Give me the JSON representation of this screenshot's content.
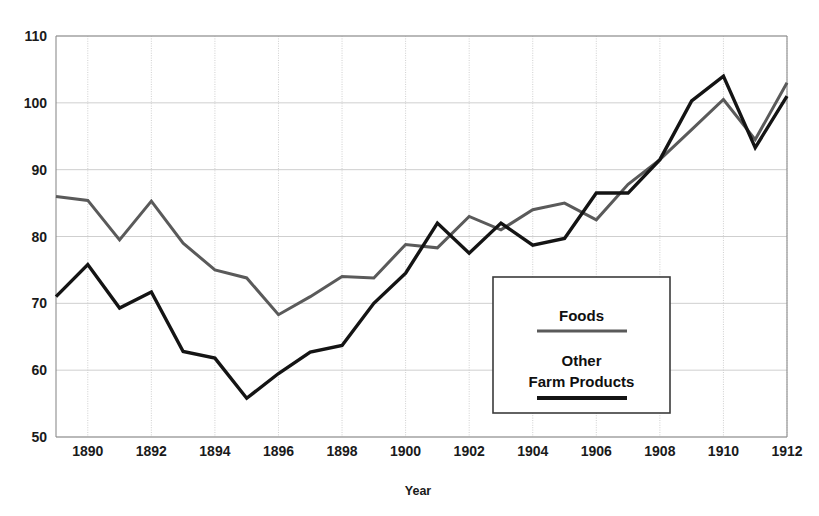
{
  "chart_data": {
    "type": "line",
    "title": "",
    "xlabel": "Year",
    "ylabel": "",
    "xlim": [
      1889,
      1912
    ],
    "ylim": [
      50,
      110
    ],
    "grid": true,
    "legend_position": "inside-right",
    "x": [
      1889,
      1890,
      1891,
      1892,
      1893,
      1894,
      1895,
      1896,
      1897,
      1898,
      1899,
      1900,
      1901,
      1902,
      1903,
      1904,
      1905,
      1906,
      1907,
      1908,
      1909,
      1910,
      1911,
      1912
    ],
    "xticks": [
      1890,
      1892,
      1894,
      1896,
      1898,
      1900,
      1902,
      1904,
      1906,
      1908,
      1910,
      1912
    ],
    "xtick_labels": [
      "1890",
      "1892",
      "1894",
      "1896",
      "1898",
      "1900",
      "1902",
      "1904",
      "1906",
      "1908",
      "1910",
      "1912"
    ],
    "yticks": [
      50,
      60,
      70,
      80,
      90,
      100,
      110
    ],
    "ytick_labels": [
      "50",
      "60",
      "70",
      "80",
      "90",
      "100",
      "110"
    ],
    "series": [
      {
        "name": "Foods",
        "color": "#5a5a5a",
        "width": 3.0,
        "values": [
          86.0,
          85.4,
          79.5,
          85.3,
          79.0,
          75.0,
          73.8,
          68.3,
          71.0,
          74.0,
          73.8,
          78.8,
          78.3,
          83.0,
          81.0,
          84.0,
          85.0,
          82.5,
          87.8,
          91.5,
          96.0,
          100.5,
          94.5,
          103.0
        ]
      },
      {
        "name": "Other Farm Products",
        "color": "#141414",
        "width": 3.4,
        "values": [
          71.0,
          75.8,
          69.3,
          71.7,
          62.8,
          61.8,
          55.8,
          59.5,
          62.7,
          63.7,
          70.0,
          74.5,
          82.0,
          77.5,
          82.0,
          78.7,
          79.7,
          86.5,
          86.5,
          91.5,
          100.3,
          104.0,
          93.3,
          101.0
        ]
      }
    ]
  },
  "legend": {
    "foods_label": "Foods",
    "other_line1": "Other",
    "other_line2": "Farm Products"
  },
  "axes": {
    "x_title": "Year"
  }
}
